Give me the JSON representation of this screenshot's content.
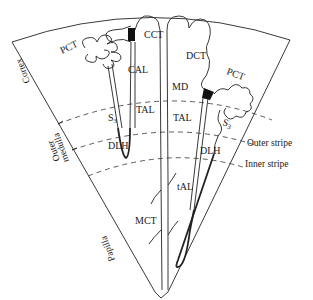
{
  "figure": {
    "type": "nephron-zones-diagram",
    "background": "#ffffff",
    "line_color": "#222222"
  },
  "zones": {
    "cortex": "Cortex",
    "outer_medulla_line1": "Outer",
    "outer_medulla_line2": "medulla",
    "papilla": "Papilla",
    "outer_stripe": "Outer stripe",
    "inner_stripe": "Inner stripe"
  },
  "segments": {
    "pct_left": "PCT",
    "cal": "CAL",
    "cct": "CCT",
    "dct": "DCT",
    "pct_right": "PCT",
    "md": "MD",
    "s3_left": "S",
    "s3_left_sub": "3",
    "tal_left": "TAL",
    "tal_right": "TAL",
    "s3_right": "S",
    "s3_right_sub": "3",
    "dlh_left": "DLH",
    "dlh_right": "DLH",
    "tal_thin": "tAL",
    "mct": "MCT"
  }
}
